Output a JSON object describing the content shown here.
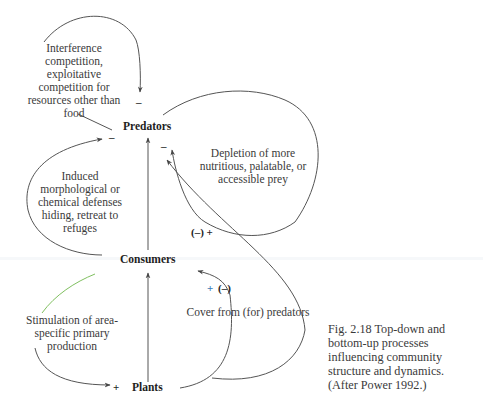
{
  "nodes": {
    "predators": "Predators",
    "consumers": "Consumers",
    "plants": "Plants"
  },
  "labels": {
    "interference": [
      "Interference",
      "competition,",
      "exploitative",
      "competition for",
      "resources other than",
      "food"
    ],
    "depletion": [
      "Depletion of more",
      "nutritious, palatable, or",
      "accessible prey"
    ],
    "induced": [
      "Induced",
      "morphological or",
      "chemical defenses",
      "hiding, retreat to",
      "refuges"
    ],
    "stimulation": [
      "Stimulation of area-",
      "specific primary",
      "production"
    ],
    "cover": "Cover from (for) predators"
  },
  "signs": {
    "predators_top": "–",
    "predators_left": "–",
    "predators_right": "–",
    "predators_plants_pair": "(–) +",
    "consumers_plants_pair_plus": "+",
    "consumers_plants_pair_minus": "(–)",
    "plants_left": "+"
  },
  "colors": {
    "ink": "#2a2a2a",
    "line": "#555555",
    "accent_plus": "#3a7ab8",
    "accent_green": "#7fbf5f"
  },
  "caption": [
    "Fig. 2.18  Top-down and",
    "bottom-up processes",
    "influencing community",
    "structure and dynamics.",
    "(After Power 1992.)"
  ]
}
